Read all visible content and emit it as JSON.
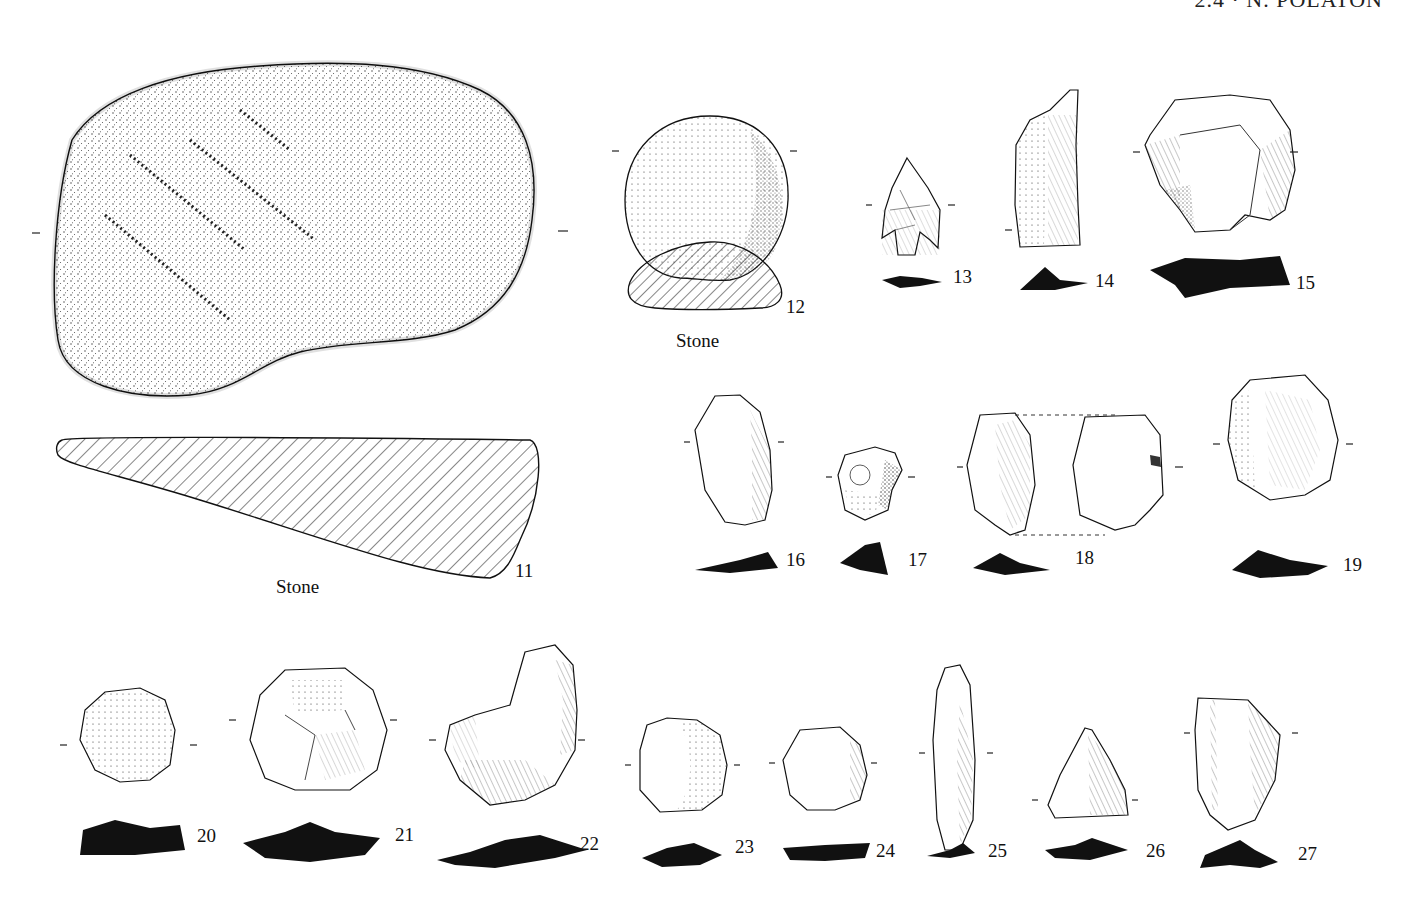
{
  "page": {
    "running_header": "2.4 · N. POLATON",
    "header_note": "Header text is clipped at the top edge; only lower halves of glyphs are visible"
  },
  "plate": {
    "items": [
      {
        "number": "11",
        "material": "Stone",
        "type": "ground stone slab",
        "views": [
          "face",
          "section (hatched)"
        ]
      },
      {
        "number": "12",
        "material": "Stone",
        "type": "round pebble / hammerstone",
        "views": [
          "face",
          "section (hatched)"
        ]
      },
      {
        "number": "13",
        "type": "tanged arrowhead",
        "views": [
          "face",
          "section (solid)"
        ]
      },
      {
        "number": "14",
        "type": "blade with cortex",
        "views": [
          "face",
          "section (solid)"
        ]
      },
      {
        "number": "15",
        "type": "core / scraper",
        "views": [
          "face",
          "section (solid)"
        ]
      },
      {
        "number": "16",
        "type": "retouched flake",
        "views": [
          "face",
          "section (solid)"
        ]
      },
      {
        "number": "17",
        "type": "notched flake",
        "views": [
          "face",
          "section (solid)"
        ]
      },
      {
        "number": "18",
        "type": "flake (dorsal & ventral)",
        "views": [
          "dorsal",
          "ventral",
          "section (solid)"
        ]
      },
      {
        "number": "19",
        "type": "side scraper with cortex",
        "views": [
          "face",
          "section (solid)"
        ]
      },
      {
        "number": "20",
        "type": "cortical disc",
        "views": [
          "face",
          "section (solid)"
        ]
      },
      {
        "number": "21",
        "type": "discoid core",
        "views": [
          "face",
          "section (solid)"
        ]
      },
      {
        "number": "22",
        "type": "retouched core tool",
        "views": [
          "face",
          "section (solid)"
        ]
      },
      {
        "number": "23",
        "type": "end scraper with cortex",
        "views": [
          "face",
          "section (solid)"
        ]
      },
      {
        "number": "24",
        "type": "round scraper",
        "views": [
          "face",
          "section (solid)"
        ]
      },
      {
        "number": "25",
        "type": "elongated blade tool",
        "views": [
          "face",
          "section (solid)"
        ]
      },
      {
        "number": "26",
        "type": "triangular point",
        "views": [
          "face",
          "section (solid)"
        ]
      },
      {
        "number": "27",
        "type": "blade segment",
        "views": [
          "face",
          "section (solid)"
        ]
      }
    ],
    "captions": {
      "c11": "Stone",
      "c12": "Stone"
    }
  },
  "colors": {
    "ink": "#111111",
    "paper": "#ffffff"
  }
}
